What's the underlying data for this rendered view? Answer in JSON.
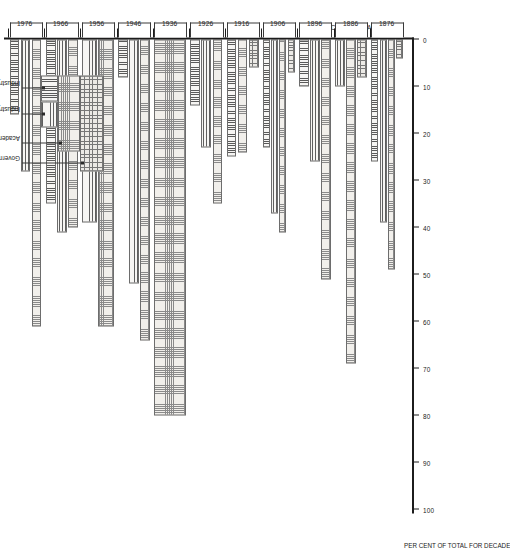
{
  "figure": {
    "x_axis_title": "PER CENT OF TOTAL FOR DECADE",
    "y_axis_title": "YEAR DECADE BEGAN"
  },
  "legend": {
    "items": [
      {
        "label": "Government",
        "pattern": "gov"
      },
      {
        "label": "Academe only",
        "pattern": "acad"
      },
      {
        "label": "Industry (corporate employees)",
        "pattern": "corp"
      },
      {
        "label": "Industry (entrepreneurs)",
        "pattern": "entr"
      }
    ]
  },
  "chart_data": {
    "type": "bar",
    "title": "",
    "xlabel": "PER CENT OF TOTAL FOR DECADE",
    "ylabel": "YEAR DECADE BEGAN",
    "orientation": "horizontal",
    "xlim": [
      0,
      100
    ],
    "xticks": [
      0,
      10,
      20,
      30,
      40,
      50,
      60,
      70,
      80,
      90,
      100
    ],
    "grid": false,
    "legend_position": "top-left",
    "categories": [
      "1876",
      "1886",
      "1896",
      "1906",
      "1916",
      "1926",
      "1936",
      "1946",
      "1956",
      "1966",
      "1976"
    ],
    "series": [
      {
        "name": "Academe only",
        "pattern": "acad",
        "values": [
          49,
          69,
          51,
          41,
          24,
          35,
          80,
          64,
          61,
          40,
          61
        ]
      },
      {
        "name": "Industry (corporate employees)",
        "pattern": "corp",
        "values": [
          39,
          10,
          26,
          37,
          0,
          23,
          0,
          52,
          39,
          41,
          28
        ]
      },
      {
        "name": "Industry (entrepreneurs)",
        "pattern": "entr",
        "values": [
          26,
          0,
          10,
          23,
          25,
          14,
          0,
          8,
          0,
          35,
          16
        ]
      },
      {
        "name": "Government",
        "pattern": "gov",
        "values": [
          4,
          8,
          0,
          7,
          6,
          0,
          0,
          0,
          0,
          0,
          0
        ]
      }
    ]
  }
}
